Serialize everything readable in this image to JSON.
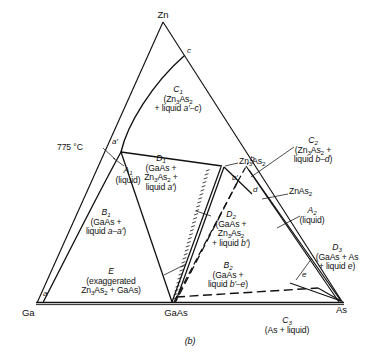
{
  "figure": {
    "caption": "(b)",
    "type": "ternary-phase-diagram",
    "system": "Ga-Zn-As",
    "isotherm": "775 °C"
  },
  "vertices": {
    "top": "Zn",
    "bottom_left": "Ga",
    "bottom_right": "As"
  },
  "compounds": {
    "gaas": "GaAs",
    "zn3as2": "Zn3As2",
    "zn3as2_html": "Zn<sub>3</sub>As<sub>2</sub>",
    "znas2": "ZnAs2",
    "znas2_html": "ZnAs<sub>2</sub>"
  },
  "annotations": {
    "temperature": "775 °C"
  },
  "points": [
    {
      "id": "a",
      "label": "a"
    },
    {
      "id": "ap",
      "label": "a′"
    },
    {
      "id": "b",
      "label": "b"
    },
    {
      "id": "bp",
      "label": "b′"
    },
    {
      "id": "c",
      "label": "c"
    },
    {
      "id": "d",
      "label": "d"
    },
    {
      "id": "e",
      "label": "e"
    }
  ],
  "regions": [
    {
      "id": "A1",
      "name_html": "A<sub>1</sub>",
      "desc_lines": [
        "(liquid)"
      ]
    },
    {
      "id": "A2",
      "name_html": "A<sub>2</sub>",
      "desc_lines": [
        "(liquid)"
      ]
    },
    {
      "id": "B1",
      "name_html": "B<sub>1</sub>",
      "desc_lines": [
        "(GaAs +",
        "liquid <i>a–a′</i>)"
      ]
    },
    {
      "id": "B2",
      "name_html": "B<sub>2</sub>",
      "desc_lines": [
        "(GaAs +",
        "liquid <i>b′–e</i>)"
      ]
    },
    {
      "id": "C1",
      "name_html": "C<sub>1</sub>",
      "desc_lines": [
        "(Zn<sub>3</sub>As<sub>2</sub>",
        "+ liquid <i>a′–c</i>)"
      ]
    },
    {
      "id": "C2",
      "name_html": "C<sub>2</sub>",
      "desc_lines": [
        "(Zn<sub>3</sub>As<sub>2</sub> +",
        "liquid <i>b–d</i>)"
      ]
    },
    {
      "id": "C3",
      "name_html": "C<sub>3</sub>",
      "desc_lines": [
        "(As + liquid)"
      ]
    },
    {
      "id": "D1",
      "name_html": "D<sub>1</sub>",
      "desc_lines": [
        "(GaAs +",
        "Zn<sub>3</sub>As<sub>2</sub> +",
        "liquid <i>a′</i>)"
      ]
    },
    {
      "id": "D2",
      "name_html": "D<sub>2</sub>",
      "desc_lines": [
        "(GaAs +",
        "Zn<sub>3</sub>As<sub>2</sub>",
        "+ liquid <i>b′</i>)"
      ]
    },
    {
      "id": "D3",
      "name_html": "D<sub>3</sub>",
      "desc_lines": [
        "(GaAs + As",
        "+ liquid <i>e</i>)"
      ]
    },
    {
      "id": "E",
      "name_html": "E",
      "desc_lines": [
        "(exaggerated",
        "Zn<sub>3</sub>As<sub>2</sub> + GaAs)"
      ]
    }
  ],
  "colors": {
    "line": "#111111",
    "background": "#ffffff"
  }
}
